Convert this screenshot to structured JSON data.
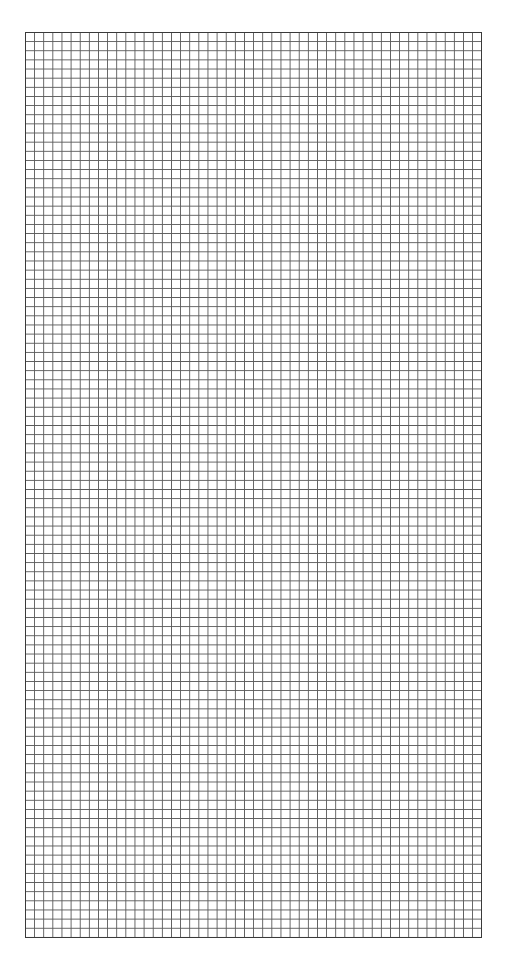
{
  "page": {
    "type": "graph-paper",
    "background_color": "#ffffff",
    "line_color": "#5a5a5a",
    "border_color": "#3a3a3a"
  },
  "grid": {
    "columns": 50,
    "rows": 99,
    "cell_width_px": 9.14,
    "cell_height_px": 9.15,
    "left_px": 25,
    "top_px": 32,
    "width_px": 457,
    "height_px": 906
  }
}
